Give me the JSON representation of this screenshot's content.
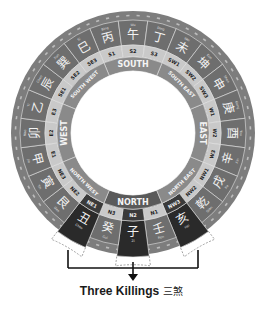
{
  "diagram": {
    "title": "Three Killings",
    "title_zh": "三煞",
    "directions": [
      {
        "label": "NORTH",
        "angle": 180
      },
      {
        "label": "NORTH EAST",
        "angle": 135
      },
      {
        "label": "EAST",
        "angle": 90
      },
      {
        "label": "SOUTH EAST",
        "angle": 45
      },
      {
        "label": "SOUTH",
        "angle": 0
      },
      {
        "label": "SOUTH WEST",
        "angle": 315
      },
      {
        "label": "WEST",
        "angle": 270
      },
      {
        "label": "NORTH WEST",
        "angle": 225
      }
    ],
    "mountains": [
      {
        "code": "S1",
        "char": "丙",
        "name": "Bing"
      },
      {
        "code": "S2",
        "char": "午",
        "name": "Wu"
      },
      {
        "code": "S3",
        "char": "丁",
        "name": "Ding"
      },
      {
        "code": "SW1",
        "char": "未",
        "name": "Wei"
      },
      {
        "code": "SW2",
        "char": "坤",
        "name": "Kun"
      },
      {
        "code": "SW3",
        "char": "申",
        "name": "Shen"
      },
      {
        "code": "W1",
        "char": "庚",
        "name": "Geng"
      },
      {
        "code": "W2",
        "char": "酉",
        "name": "You"
      },
      {
        "code": "W3",
        "char": "辛",
        "name": "Xin"
      },
      {
        "code": "NW1",
        "char": "戌",
        "name": "Xu"
      },
      {
        "code": "NW2",
        "char": "乾",
        "name": "Qian"
      },
      {
        "code": "NW3",
        "char": "亥",
        "name": "Hai",
        "highlight": true
      },
      {
        "code": "N1",
        "char": "壬",
        "name": "Ren"
      },
      {
        "code": "N2",
        "char": "子",
        "name": "Zi",
        "highlight": true
      },
      {
        "code": "N3",
        "char": "癸",
        "name": "Gui"
      },
      {
        "code": "NE1",
        "char": "丑",
        "name": "Chou",
        "highlight": true
      },
      {
        "code": "NE2",
        "char": "艮",
        "name": "Gen"
      },
      {
        "code": "NE3",
        "char": "寅",
        "name": "Yin"
      },
      {
        "code": "E1",
        "char": "甲",
        "name": "Jia"
      },
      {
        "code": "E2",
        "char": "卯",
        "name": "Mao"
      },
      {
        "code": "E3",
        "char": "乙",
        "name": "Yi"
      },
      {
        "code": "SE1",
        "char": "辰",
        "name": "Chen"
      },
      {
        "code": "SE2",
        "char": "巽",
        "name": "Xun"
      },
      {
        "code": "SE3",
        "char": "巳",
        "name": "Si"
      }
    ],
    "colors": {
      "outer_ring": "#7d7d7d",
      "mountain_ring": "#6e6e6e",
      "code_ring": "#c9c9c9",
      "direction_ring": "#8a8a8a",
      "highlight": "#2a2a2a",
      "line": "#e6e6e6"
    }
  }
}
